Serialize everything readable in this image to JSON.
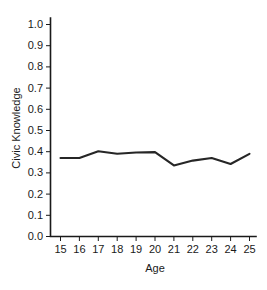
{
  "chart_data": {
    "type": "line",
    "title": "",
    "subtitle": "",
    "xlabel": "Age",
    "ylabel": "Civic Knowledge",
    "x": [
      15,
      16,
      17,
      18,
      19,
      20,
      21,
      22,
      23,
      24,
      25
    ],
    "xticklabels": [
      "15",
      "16",
      "17",
      "18",
      "19",
      "20",
      "21",
      "22",
      "23",
      "24",
      "25"
    ],
    "yticks": [
      0.0,
      0.1,
      0.2,
      0.3,
      0.4,
      0.5,
      0.6,
      0.7,
      0.8,
      0.9,
      1.0
    ],
    "yticklabels": [
      "0.0",
      "0.1",
      "0.2",
      "0.3",
      "0.4",
      "0.5",
      "0.6",
      "0.7",
      "0.8",
      "0.9",
      "1.0"
    ],
    "xlim": [
      15,
      25
    ],
    "ylim": [
      0.0,
      1.0
    ],
    "grid": false,
    "legend": false,
    "legend_position": "none",
    "line_color": "#262626",
    "series": [
      {
        "name": "Civic Knowledge",
        "values": [
          0.37,
          0.37,
          0.402,
          0.39,
          0.396,
          0.398,
          0.335,
          0.358,
          0.37,
          0.342,
          0.39
        ]
      }
    ],
    "annotations": []
  },
  "axes": {
    "y_axis_title": "Civic Knowledge",
    "x_axis_title": "Age"
  }
}
